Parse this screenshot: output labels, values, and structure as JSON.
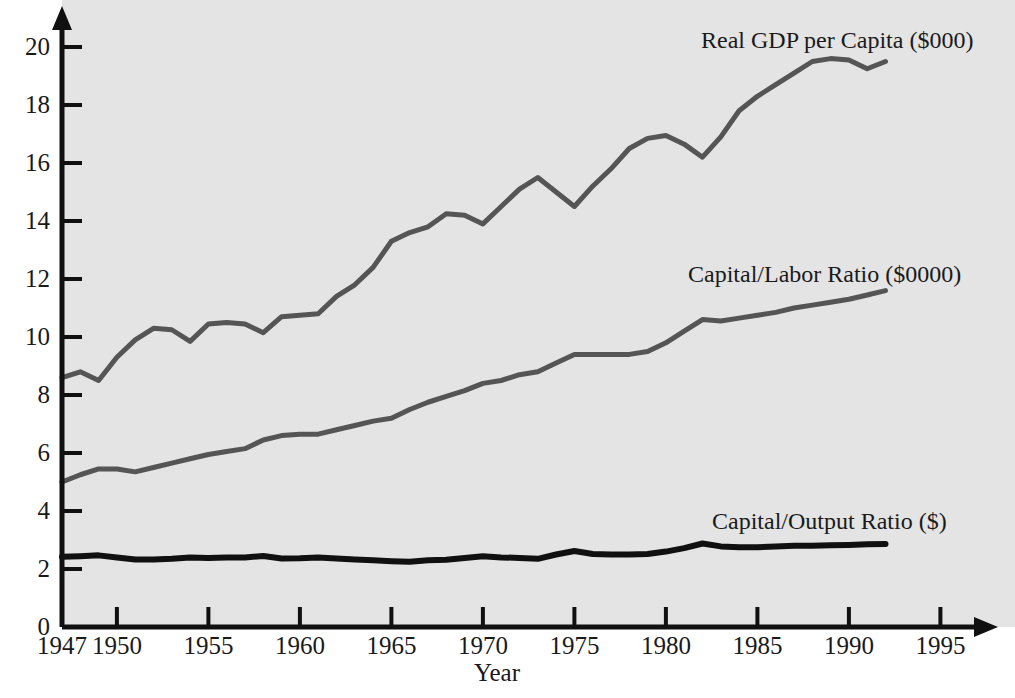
{
  "chart_data": {
    "type": "line",
    "title": "",
    "xlabel": "Year",
    "ylabel": "",
    "xlim": [
      1947,
      1996.5
    ],
    "ylim": [
      0,
      20.6
    ],
    "grid": false,
    "legend_position": "inline-right",
    "x_ticks": [
      1947,
      1950,
      1955,
      1960,
      1965,
      1970,
      1975,
      1980,
      1985,
      1990,
      1995
    ],
    "x_tick_labels": [
      "1947",
      "1950",
      "1955",
      "1960",
      "1965",
      "1970",
      "1975",
      "1980",
      "1985",
      "1990",
      "1995"
    ],
    "y_ticks": [
      0,
      2,
      4,
      6,
      8,
      10,
      12,
      14,
      16,
      18,
      20
    ],
    "y_tick_labels": [
      "0",
      "2",
      "4",
      "6",
      "8",
      "10",
      "12",
      "14",
      "16",
      "18",
      "20"
    ],
    "x": [
      1947,
      1948,
      1949,
      1950,
      1951,
      1952,
      1953,
      1954,
      1955,
      1956,
      1957,
      1958,
      1959,
      1960,
      1961,
      1962,
      1963,
      1964,
      1965,
      1966,
      1967,
      1968,
      1969,
      1970,
      1971,
      1972,
      1973,
      1974,
      1975,
      1976,
      1977,
      1978,
      1979,
      1980,
      1981,
      1982,
      1983,
      1984,
      1985,
      1986,
      1987,
      1988,
      1989,
      1990,
      1991,
      1992
    ],
    "series": [
      {
        "name": "Real GDP per Capita ($000)",
        "color": "#555555",
        "line_width": 5,
        "label_text": "Real GDP per Capita ($000)",
        "values": [
          8.6,
          8.8,
          8.5,
          9.3,
          9.9,
          10.3,
          10.25,
          9.85,
          10.45,
          10.5,
          10.45,
          10.15,
          10.7,
          10.75,
          10.8,
          11.4,
          11.8,
          12.4,
          13.3,
          13.6,
          13.8,
          14.25,
          14.2,
          13.9,
          14.5,
          15.1,
          15.5,
          15.0,
          14.5,
          15.2,
          15.8,
          16.5,
          16.85,
          16.95,
          16.65,
          16.2,
          16.9,
          17.8,
          18.3,
          18.7,
          19.1,
          19.5,
          19.6,
          19.55,
          19.25,
          19.5
        ]
      },
      {
        "name": "Capital/Labor Ratio ($0000)",
        "color": "#555555",
        "line_width": 5,
        "label_text": "Capital/Labor Ratio ($0000)",
        "values": [
          5.0,
          5.25,
          5.45,
          5.45,
          5.35,
          5.5,
          5.65,
          5.8,
          5.95,
          6.05,
          6.15,
          6.45,
          6.6,
          6.65,
          6.65,
          6.8,
          6.95,
          7.1,
          7.2,
          7.5,
          7.75,
          7.95,
          8.15,
          8.4,
          8.5,
          8.7,
          8.8,
          9.1,
          9.4,
          9.4,
          9.4,
          9.4,
          9.5,
          9.8,
          10.2,
          10.6,
          10.55,
          10.65,
          10.75,
          10.85,
          11.0,
          11.1,
          11.2,
          11.3,
          11.45,
          11.6
        ]
      },
      {
        "name": "Capital/Output Ratio ($)",
        "color": "#101010",
        "line_width": 6,
        "label_text": "Capital/Output Ratio ($)",
        "values": [
          2.42,
          2.44,
          2.47,
          2.4,
          2.33,
          2.33,
          2.35,
          2.4,
          2.38,
          2.4,
          2.4,
          2.45,
          2.36,
          2.37,
          2.4,
          2.36,
          2.33,
          2.3,
          2.27,
          2.25,
          2.3,
          2.32,
          2.38,
          2.44,
          2.4,
          2.38,
          2.35,
          2.5,
          2.62,
          2.52,
          2.5,
          2.5,
          2.52,
          2.6,
          2.72,
          2.88,
          2.78,
          2.75,
          2.75,
          2.78,
          2.8,
          2.8,
          2.82,
          2.83,
          2.85,
          2.86
        ]
      }
    ],
    "annotations": [
      {
        "text": "Real GDP per Capita ($000)",
        "x_px": 701,
        "y_px": 28
      },
      {
        "text": "Capital/Labor Ratio ($0000)",
        "x_px": 688,
        "y_px": 262
      },
      {
        "text": "Capital/Output Ratio ($)",
        "x_px": 712,
        "y_px": 509
      }
    ],
    "axis_color": "#101010",
    "plot_background": "#e4e4e4",
    "page_background": "#ffffff"
  }
}
